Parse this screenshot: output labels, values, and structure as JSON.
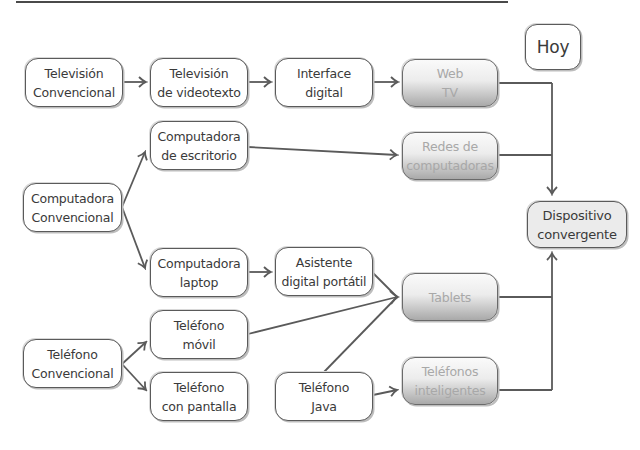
{
  "diagram": {
    "type": "evolution-flow",
    "today_label": "Hoy",
    "colors": {
      "line": "#5a5a5a",
      "box_border": "#5a5a5a",
      "text": "#3a3a3a",
      "future_text": "#a8a8a8",
      "target_fill": "#ebebeb"
    },
    "nodes": {
      "tv_conv": "Televisión\nConvencional",
      "tv_videotexto": "Televisión\nde videotexto",
      "interface_digital": "Interface\ndigital",
      "web_tv": "Web\nTV",
      "comp_escritorio": "Computadora\nde escritorio",
      "redes": "Redes de\ncomputadoras",
      "comp_conv": "Computadora\nConvencional",
      "dispositivo": "Dispositivo\nconvergente",
      "comp_laptop": "Computadora\nlaptop",
      "asistente": "Asistente\ndigital portátil",
      "tablets": "Tablets",
      "tel_movil": "Teléfono\nmóvil",
      "tel_conv": "Teléfono\nConvencional",
      "tel_pantalla": "Teléfono\ncon pantalla",
      "tel_java": "Teléfono\nJava",
      "tel_inteligentes": "Teléfonos\ninteligentes"
    },
    "edges": [
      [
        "tv_conv",
        "tv_videotexto"
      ],
      [
        "tv_videotexto",
        "interface_digital"
      ],
      [
        "interface_digital",
        "web_tv"
      ],
      [
        "comp_conv",
        "comp_escritorio"
      ],
      [
        "comp_conv",
        "comp_laptop"
      ],
      [
        "comp_escritorio",
        "redes"
      ],
      [
        "comp_laptop",
        "asistente"
      ],
      [
        "asistente",
        "tablets"
      ],
      [
        "tel_movil",
        "tablets"
      ],
      [
        "tel_java",
        "tablets"
      ],
      [
        "tel_conv",
        "tel_movil"
      ],
      [
        "tel_conv",
        "tel_pantalla"
      ],
      [
        "tel_java",
        "tel_inteligentes"
      ],
      [
        "web_tv",
        "dispositivo"
      ],
      [
        "redes",
        "dispositivo"
      ],
      [
        "tablets",
        "dispositivo"
      ],
      [
        "tel_inteligentes",
        "dispositivo"
      ]
    ]
  }
}
